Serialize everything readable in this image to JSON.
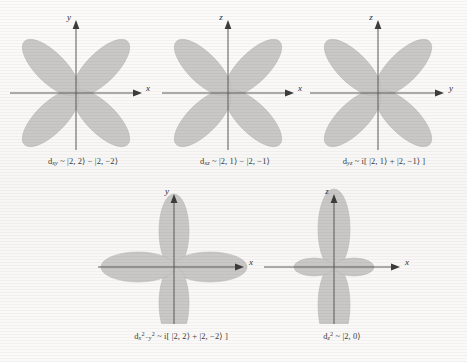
{
  "figure": {
    "background_color": "#fbfaf9",
    "lobe_color": "#c9c8c6",
    "axis_color": "#5a5a5a",
    "panels": [
      {
        "id": "dxy",
        "orbital_label": "d",
        "subscript": "xy",
        "caption_text": "d<sub>xy</sub> ~ |2, 2&rang; &minus; |2, &minus;2&rang;",
        "caption_plain": "dxy ~ |2, 2> - |2, -2>",
        "vertical_axis": "y",
        "horizontal_axis": "x",
        "lobe_orientation": "diagonal",
        "lobe_count": 4,
        "lobe_angles_deg": [
          45,
          135,
          225,
          315
        ]
      },
      {
        "id": "dxz",
        "orbital_label": "d",
        "subscript": "xz",
        "caption_text": "d<sub>xz</sub> ~ |2, 1&rang; &minus; |2, &minus;1&rang;",
        "caption_plain": "dxz ~ |2, 1> - |2, -1>",
        "vertical_axis": "z",
        "horizontal_axis": "x",
        "lobe_orientation": "diagonal",
        "lobe_count": 4,
        "lobe_angles_deg": [
          45,
          135,
          225,
          315
        ]
      },
      {
        "id": "dyz",
        "orbital_label": "d",
        "subscript": "yz",
        "caption_text": "d<sub>yz</sub> ~ i[ |2, 1&rang; + |2, &minus;1&rang; ]",
        "caption_plain": "dyz ~ i[|2, 1> + |2, -1>]",
        "vertical_axis": "z",
        "horizontal_axis": "y",
        "lobe_orientation": "diagonal",
        "lobe_count": 4,
        "lobe_angles_deg": [
          45,
          135,
          225,
          315
        ]
      },
      {
        "id": "dx2-y2",
        "orbital_label": "d",
        "subscript": "x2-y2",
        "caption_text": "d<sub>x</sub><sup>2</sup><sub>&minus;y</sub><sup>2</sup> ~ i[ |2, 2&rang; + |2, &minus;2&rang; ]",
        "caption_plain": "dx2-y2 ~ i[|2, 2> + |2, -2>]",
        "vertical_axis": "y",
        "horizontal_axis": "x",
        "lobe_orientation": "axial",
        "lobe_count": 4,
        "lobe_angles_deg": [
          0,
          90,
          180,
          270
        ]
      },
      {
        "id": "dz2",
        "orbital_label": "d",
        "subscript": "z2",
        "caption_text": "d<sub>z</sub><sup>2</sup> ~ |2, 0&rang;",
        "caption_plain": "dz2 ~ |2, 0>",
        "vertical_axis": "z",
        "horizontal_axis": "x",
        "lobe_orientation": "z-squared",
        "lobe_count": 4,
        "lobe_angles_deg": [
          90,
          270,
          0,
          180
        ]
      }
    ]
  },
  "axis_labels": {
    "x": "x",
    "y": "y",
    "z": "z"
  }
}
